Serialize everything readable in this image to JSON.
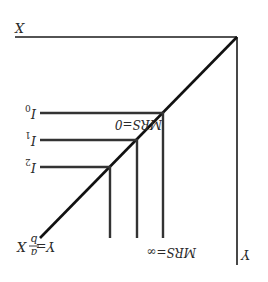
{
  "diagram": {
    "orientation": "rotated-180",
    "axes": {
      "x_label": "X",
      "y_label": "Y"
    },
    "ray": {
      "label_lhs": "Y=",
      "label_num": "a",
      "label_den": "b",
      "label_rhs": "X"
    },
    "curves": [
      {
        "name": "I",
        "sub": "0"
      },
      {
        "name": "I",
        "sub": "1"
      },
      {
        "name": "I",
        "sub": "2"
      }
    ],
    "annotations": {
      "mrs_zero": "MRS=0",
      "mrs_inf": "MRS=∞"
    },
    "colors": {
      "line": "#1a1a1a",
      "curve": "#3a3a3a",
      "background": "#ffffff"
    }
  }
}
